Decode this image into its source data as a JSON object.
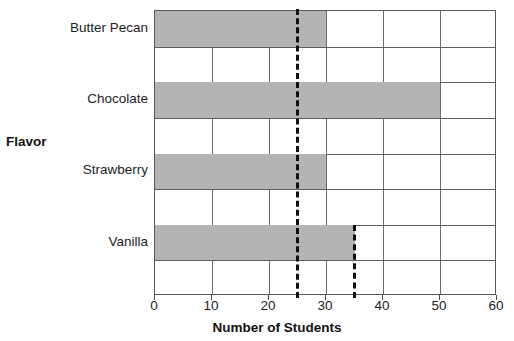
{
  "chart_data": {
    "type": "bar",
    "orientation": "horizontal",
    "title": "",
    "xlabel": "Number of Students",
    "ylabel": "Flavor",
    "categories": [
      "Butter Pecan",
      "Chocolate",
      "Strawberry",
      "Vanilla"
    ],
    "values": [
      30,
      50,
      30,
      35
    ],
    "xlim": [
      0,
      60
    ],
    "xticks": [
      0,
      10,
      20,
      30,
      40,
      50,
      60
    ],
    "xtick_labels": [
      "0",
      "10",
      "20",
      "30",
      "40",
      "50",
      "60"
    ],
    "grid": true,
    "legend": "none",
    "bar_color": "#b4b4b4",
    "frame_color": "#585858",
    "gridline_color": "#6b6b6b",
    "annotations": [
      {
        "name": "median-reference-line",
        "value": 25,
        "style": "dashed",
        "color": "#101010",
        "span": "full-plot-height"
      },
      {
        "name": "secondary-reference-line",
        "value": 35,
        "style": "dashed",
        "color": "#101010",
        "span": "from-vanilla-bar-top-to-axis"
      }
    ]
  }
}
